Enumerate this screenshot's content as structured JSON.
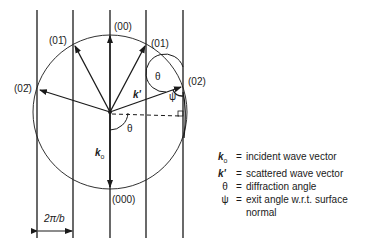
{
  "diagram": {
    "type": "Ewald sphere construction (reciprocal lattice rods)",
    "rods": {
      "x_positions": [
        37,
        73,
        110,
        146,
        183
      ],
      "y_top": 10,
      "y_bottom": 238
    },
    "circle": {
      "cx": 110,
      "cy": 112,
      "r": 77
    },
    "reflections": [
      {
        "id": "00",
        "label": "(00)",
        "x": 110,
        "y": 35
      },
      {
        "id": "01",
        "label": "(01)",
        "x": 146,
        "y": 44
      },
      {
        "id": "01b",
        "label": "(01̄)",
        "x": 74,
        "y": 44
      },
      {
        "id": "02",
        "label": "(02)",
        "x": 183,
        "y": 86
      },
      {
        "id": "02b",
        "label": "(02̄)",
        "x": 38,
        "y": 90
      },
      {
        "id": "000",
        "label": "(000)",
        "x": 110,
        "y": 189
      }
    ],
    "vector_labels": {
      "k_prime": "k'",
      "k0": "k",
      "k0_sub": "o",
      "theta": "θ",
      "psi": "ψ"
    },
    "spacing_label": "2π/b"
  },
  "legend": [
    {
      "symbol": "k",
      "sub": "o",
      "eq": "=",
      "text": "incident wave vector"
    },
    {
      "symbol": "k'",
      "sub": "",
      "eq": "=",
      "text": "scattered wave vector"
    },
    {
      "symbol": "θ",
      "sub": "",
      "eq": "=",
      "text": "diffraction angle"
    },
    {
      "symbol": "ψ",
      "sub": "",
      "eq": "=",
      "text": "exit angle w.r.t. surface",
      "continuation": "normal"
    }
  ],
  "colors": {
    "ink": "#1a1a1a",
    "background": "#ffffff"
  }
}
